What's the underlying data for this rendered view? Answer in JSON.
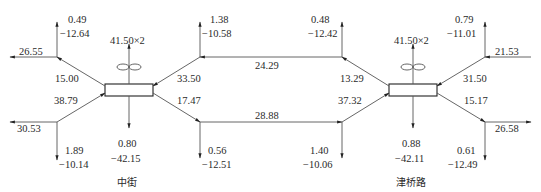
{
  "stations": [
    {
      "name": "中街",
      "output": "41.50×2",
      "down_p": "0.80",
      "down_q": "−42.15"
    },
    {
      "name": "津桥路",
      "output": "41.50×2",
      "down_p": "0.88",
      "down_q": "−42.11"
    }
  ],
  "nodes": {
    "left_top": {
      "up_p": "0.49",
      "up_q": "−12.64",
      "out": "26.55",
      "branch": "15.00"
    },
    "left_bottom": {
      "down_p": "1.89",
      "down_q": "−10.14",
      "out": "30.53",
      "branch": "38.79"
    },
    "midleft_top": {
      "up_p": "1.38",
      "up_q": "−10.58",
      "branch": "33.50"
    },
    "midleft_bottom": {
      "down_p": "0.56",
      "down_q": "−12.51",
      "branch": "17.47"
    },
    "midright_top": {
      "up_p": "0.48",
      "up_q": "−12.42",
      "branch": "13.29"
    },
    "midright_bottom": {
      "down_p": "1.40",
      "down_q": "−10.06",
      "branch": "37.32"
    },
    "right_top": {
      "up_p": "0.79",
      "up_q": "−11.01",
      "in": "21.53",
      "branch": "31.50"
    },
    "right_bottom": {
      "down_p": "0.61",
      "down_q": "−12.49",
      "out": "26.58",
      "branch": "15.17"
    }
  },
  "links": {
    "top": "24.29",
    "bottom": "28.88"
  }
}
